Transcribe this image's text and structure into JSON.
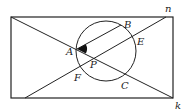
{
  "diagram": {
    "type": "geometry",
    "colors": {
      "stroke": "#222222",
      "background": "#ffffff",
      "shade": "#111111"
    },
    "rectangle": {
      "x": 11,
      "y": 17,
      "width": 162,
      "height": 81
    },
    "circle": {
      "cx": 106,
      "cy": 51,
      "r": 30
    },
    "points": {
      "A": {
        "label": "A",
        "x": 77,
        "y": 49
      },
      "B": {
        "label": "B",
        "x": 121,
        "y": 25
      },
      "C": {
        "label": "C",
        "x": 126,
        "y": 79
      },
      "E": {
        "label": "E",
        "x": 135,
        "y": 36
      },
      "F": {
        "label": "F",
        "x": 79,
        "y": 73
      },
      "P": {
        "label": "P",
        "x": 89,
        "y": 55
      }
    },
    "lines": {
      "n": {
        "label": "n",
        "x1": 25,
        "y1": 98,
        "x2": 166,
        "y2": 17
      },
      "k": {
        "label": "k",
        "x1": 11,
        "y1": 17,
        "x2": 173,
        "y2": 98
      },
      "AB": {
        "label": "",
        "x1": 77,
        "y1": 49,
        "x2": 121,
        "y2": 25
      }
    },
    "labels": {
      "A": "A",
      "B": "B",
      "C": "C",
      "E": "E",
      "F": "F",
      "P": "P",
      "n": "n",
      "k": "k"
    },
    "shaded_angle": {
      "vertex": "A",
      "between": [
        "AB",
        "k"
      ]
    }
  }
}
